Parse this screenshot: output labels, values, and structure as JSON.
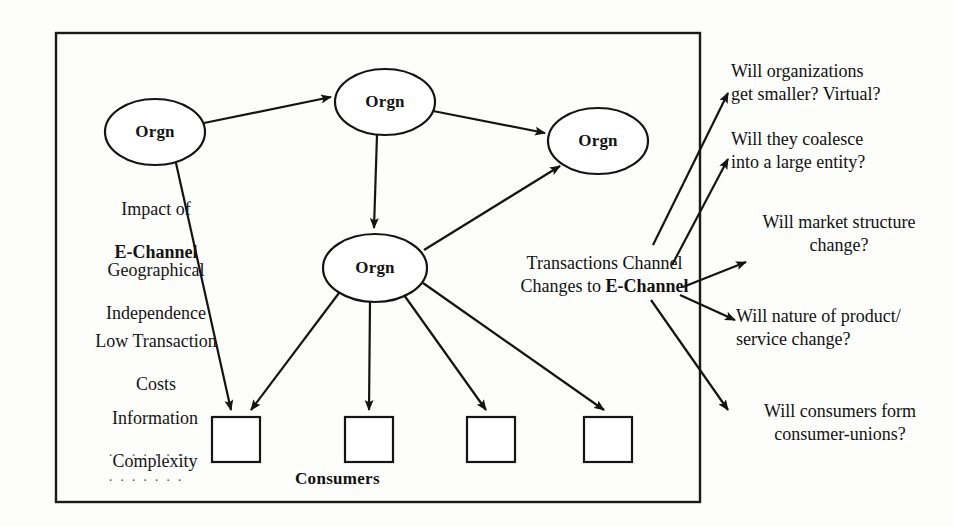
{
  "diagram": {
    "frame": {
      "label": "organization-consumer-boundary"
    },
    "nodes": [
      {
        "id": "orgn-left",
        "label": "Orgn",
        "shape": "ellipse",
        "cx": 155,
        "cy": 132,
        "rx": 50,
        "ry": 33
      },
      {
        "id": "orgn-top",
        "label": "Orgn",
        "shape": "ellipse",
        "cx": 385,
        "cy": 102,
        "rx": 50,
        "ry": 33
      },
      {
        "id": "orgn-right",
        "label": "Orgn",
        "shape": "ellipse",
        "cx": 598,
        "cy": 141,
        "rx": 50,
        "ry": 33
      },
      {
        "id": "orgn-center",
        "label": "Orgn",
        "shape": "ellipse",
        "cx": 375,
        "cy": 268,
        "rx": 52,
        "ry": 34
      }
    ],
    "consumer_boxes": [
      {
        "id": "consumer-box-1",
        "x": 212,
        "y": 417,
        "w": 48,
        "h": 45
      },
      {
        "id": "consumer-box-2",
        "x": 345,
        "y": 417,
        "w": 48,
        "h": 45
      },
      {
        "id": "consumer-box-3",
        "x": 467,
        "y": 417,
        "w": 48,
        "h": 45
      },
      {
        "id": "consumer-box-4",
        "x": 584,
        "y": 417,
        "w": 48,
        "h": 45
      }
    ],
    "consumers_label": "Consumers",
    "left_notes": [
      {
        "line1": "Impact of",
        "line2": "E-Channel",
        "line2_bold": true
      },
      {
        "line1": "Geographical",
        "line2": "Independence",
        "line2_bold": false
      },
      {
        "line1": "Low Transaction",
        "line2": "Costs",
        "line2_bold": false
      },
      {
        "line1": "Information",
        "line2": "Complexity",
        "line2_bold": false
      }
    ],
    "left_ellipsis": [
      ". . . . . . .",
      ". . . . . . ."
    ],
    "transactions_label": {
      "line1": "Transactions Channel",
      "line2_prefix": "Changes to ",
      "line2_bold": "E-Channel"
    },
    "questions": [
      {
        "id": "question-1",
        "line1": "Will organizations",
        "line2": "get smaller? Virtual?",
        "align": "left"
      },
      {
        "id": "question-2",
        "line1": "Will they coalesce",
        "line2": "into a large entity?",
        "align": "left"
      },
      {
        "id": "question-3",
        "line1": "Will market structure",
        "line2": "change?",
        "align": "center"
      },
      {
        "id": "question-4",
        "line1": "Will nature of product/",
        "line2": "service change?",
        "align": "left"
      },
      {
        "id": "question-5",
        "line1": "Will consumers form",
        "line2": "consumer-unions?",
        "align": "center"
      }
    ],
    "colors": {
      "ink": "#141414",
      "stroke": "#1a1a1a",
      "page_background": "#fdfdfc"
    }
  }
}
